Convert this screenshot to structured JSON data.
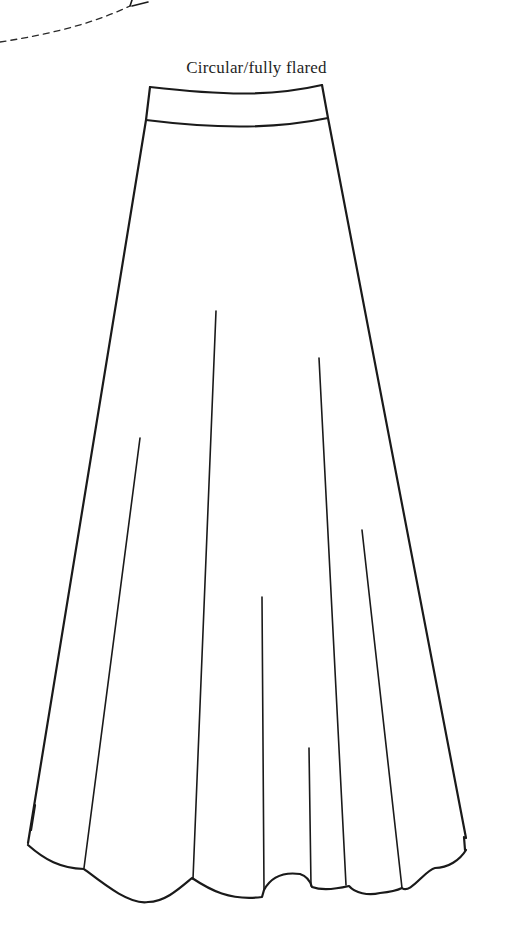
{
  "figure": {
    "caption": "Circular/fully flared",
    "style": "line-drawing",
    "colors": {
      "ink": "#1a1a1a",
      "background": "#ffffff"
    },
    "elements": {
      "dashed_curve": "partial pattern outline (top-left, cut off)",
      "waistband": "curved waistband band",
      "skirt_body": "flared A-line skirt outline",
      "fold_lines": 8,
      "hem": "scalloped flared hem"
    }
  }
}
